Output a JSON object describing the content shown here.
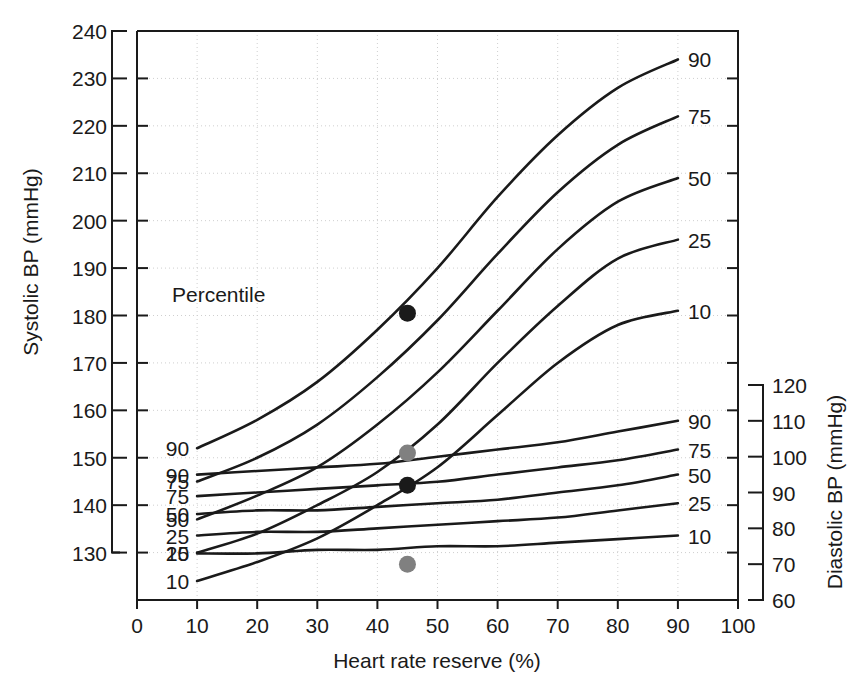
{
  "chart_data": {
    "type": "line",
    "title": "",
    "subtitle": "",
    "xlabel": "Heart rate reserve (%)",
    "ylabel": "Systolic BP (mmHg)",
    "y2label": "Diastolic BP (mmHg)",
    "xlim": [
      0,
      100
    ],
    "ylim": [
      120,
      240
    ],
    "y2lim": [
      60,
      120
    ],
    "xticks": [
      "0",
      "10",
      "20",
      "30",
      "40",
      "50",
      "60",
      "70",
      "80",
      "90",
      "100"
    ],
    "xtick_values": [
      0,
      10,
      20,
      30,
      40,
      50,
      60,
      70,
      80,
      90,
      100
    ],
    "yticks": [
      "130",
      "140",
      "150",
      "160",
      "170",
      "180",
      "190",
      "200",
      "210",
      "220",
      "230",
      "240"
    ],
    "ytick_values": [
      130,
      140,
      150,
      160,
      170,
      180,
      190,
      200,
      210,
      220,
      230,
      240
    ],
    "y2ticks": [
      "60",
      "70",
      "80",
      "90",
      "100",
      "110",
      "120"
    ],
    "y2tick_values": [
      60,
      70,
      80,
      90,
      100,
      110,
      120
    ],
    "grid": true,
    "legend_position": "inline-curve-labels",
    "legend_title": "Percentile",
    "x": [
      10,
      20,
      30,
      40,
      50,
      60,
      70,
      80,
      90
    ],
    "systolic_series": [
      {
        "name": "90",
        "label_left": "90",
        "label_right": "90",
        "values": [
          152,
          158,
          166,
          177,
          190,
          205,
          218,
          228,
          234
        ]
      },
      {
        "name": "75",
        "label_left": "75",
        "label_right": "75",
        "values": [
          145,
          150,
          157,
          167,
          179,
          193,
          206,
          216,
          222
        ]
      },
      {
        "name": "50",
        "label_left": "50",
        "label_right": "50",
        "values": [
          137,
          142,
          148,
          157,
          168,
          181,
          194,
          204,
          209
        ]
      },
      {
        "name": "25",
        "label_left": "25",
        "label_right": "25",
        "values": [
          130,
          134,
          140,
          147,
          157,
          170,
          182,
          192,
          196
        ]
      },
      {
        "name": "10",
        "label_left": "10",
        "label_right": "10",
        "values": [
          124,
          128,
          133,
          140,
          148,
          159,
          170,
          178,
          181
        ]
      }
    ],
    "diastolic_series": [
      {
        "name": "90",
        "label_left": "90",
        "label_right": "90",
        "values": [
          95,
          96,
          97,
          98,
          100,
          102,
          104,
          107,
          110
        ]
      },
      {
        "name": "75",
        "label_left": "75",
        "label_right": "75",
        "values": [
          89,
          90,
          91,
          92,
          93,
          95,
          97,
          99,
          102
        ]
      },
      {
        "name": "50",
        "label_left": "50",
        "label_right": "50",
        "values": [
          84,
          85,
          85,
          86,
          87,
          88,
          90,
          92,
          95
        ]
      },
      {
        "name": "25",
        "label_left": "25",
        "label_right": "25",
        "values": [
          78,
          79,
          79,
          80,
          81,
          82,
          83,
          85,
          87
        ]
      },
      {
        "name": "10",
        "label_left": "10",
        "label_right": "10",
        "values": [
          73,
          73,
          74,
          74,
          75,
          75,
          76,
          77,
          78
        ]
      }
    ],
    "points": [
      {
        "name": "systolic-black-point",
        "x": 45,
        "y": 180.5,
        "axis": "systolic",
        "color": "#1a1a1a"
      },
      {
        "name": "systolic-gray-point",
        "x": 45,
        "y": 151.0,
        "axis": "systolic",
        "color": "#808080"
      },
      {
        "name": "diastolic-black-point",
        "x": 45,
        "y": 92.0,
        "axis": "diastolic",
        "color": "#1a1a1a"
      },
      {
        "name": "diastolic-gray-point",
        "x": 45,
        "y": 70.0,
        "axis": "diastolic",
        "color": "#808080"
      }
    ],
    "colors": {
      "curve": "#1a1a1a",
      "grid": "#cfcfcf",
      "axis": "#1a1a1a",
      "point_dark": "#1a1a1a",
      "point_gray": "#808080",
      "background": "#ffffff"
    }
  }
}
